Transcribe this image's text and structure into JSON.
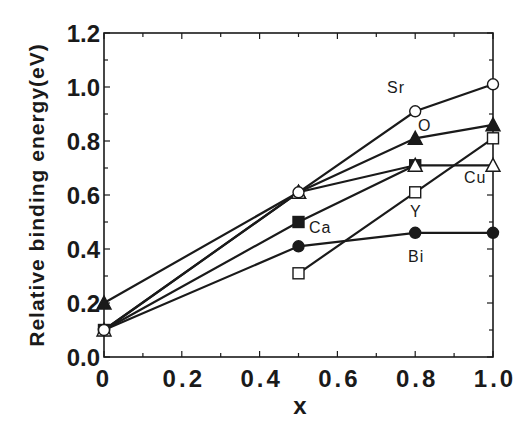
{
  "chart_data": {
    "type": "line",
    "title": "",
    "xlabel": "x",
    "ylabel": "Relative binding energy(eV)",
    "xlim": [
      0,
      1.0
    ],
    "ylim": [
      0,
      1.2
    ],
    "x_ticks": [
      "0",
      "0.2",
      "0.4",
      "0.6",
      "0.8",
      "1.0"
    ],
    "y_ticks": [
      "0.0",
      "0.2",
      "0.4",
      "0.6",
      "0.8",
      "1.0",
      "1.2"
    ],
    "grid": false,
    "legend": "inline labels",
    "series": [
      {
        "name": "Sr",
        "marker": "open-circle",
        "x": [
          0,
          0.5,
          0.8,
          1.0
        ],
        "values": [
          0.1,
          0.61,
          0.91,
          1.01
        ]
      },
      {
        "name": "O",
        "marker": "filled-triangle",
        "x": [
          0,
          0.5,
          0.8,
          1.0
        ],
        "values": [
          0.2,
          0.61,
          0.81,
          0.86
        ]
      },
      {
        "name": "Cu",
        "marker": "open-triangle",
        "x": [
          0,
          0.5,
          0.8,
          1.0
        ],
        "values": [
          0.1,
          0.61,
          0.71,
          0.71
        ]
      },
      {
        "name": "Ca",
        "marker": "filled-square",
        "x": [
          0,
          0.5,
          0.8
        ],
        "values": [
          0.1,
          0.5,
          0.71
        ]
      },
      {
        "name": "Bi",
        "marker": "filled-circle",
        "x": [
          0,
          0.5,
          0.8,
          1.0
        ],
        "values": [
          0.1,
          0.41,
          0.46,
          0.46
        ]
      },
      {
        "name": "Y",
        "marker": "open-square",
        "x": [
          0.5,
          0.8,
          1.0
        ],
        "values": [
          0.31,
          0.61,
          0.81
        ]
      }
    ],
    "labels": [
      {
        "text": "Sr",
        "px": 387,
        "py": 93
      },
      {
        "text": "O",
        "px": 418,
        "py": 131
      },
      {
        "text": "Cu",
        "px": 464,
        "py": 183
      },
      {
        "text": "Ca",
        "px": 309,
        "py": 233
      },
      {
        "text": "Y",
        "px": 410,
        "py": 217
      },
      {
        "text": "Bi",
        "px": 408,
        "py": 262
      }
    ],
    "colors": {
      "ink": "#1a1a1a",
      "background": "#ffffff"
    }
  }
}
